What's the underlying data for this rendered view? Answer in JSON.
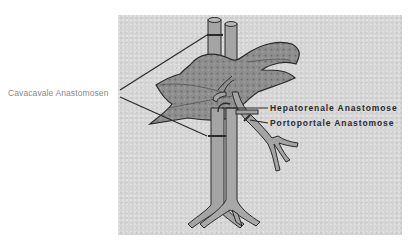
{
  "diagram": {
    "type": "anatomical-illustration",
    "colors": {
      "panel_background": "#d6d6d6",
      "liver_fill": "#8e8e8e",
      "vessel_fill": "#a4a4a4",
      "outline": "#2a2a2a",
      "left_label_color": "#8a8a8a",
      "right_label_color": "#2a2a2a"
    },
    "labels": {
      "cavacaval": "Cavacavale Anastomosen",
      "hepatorenal": "Hepatorenale Anastomose",
      "portoportal": "Portoportale Anastomose"
    },
    "leader_lines": [
      {
        "from_label": "cavacaval",
        "target": "upper vena cava anastomosis ring"
      },
      {
        "from_label": "cavacaval",
        "target": "lower vena cava anastomosis ring"
      },
      {
        "from_label": "hepatorenal",
        "target": "hepatorenal connection at hilum"
      },
      {
        "from_label": "portoportal",
        "target": "portal vein anastomosis ring"
      }
    ]
  }
}
